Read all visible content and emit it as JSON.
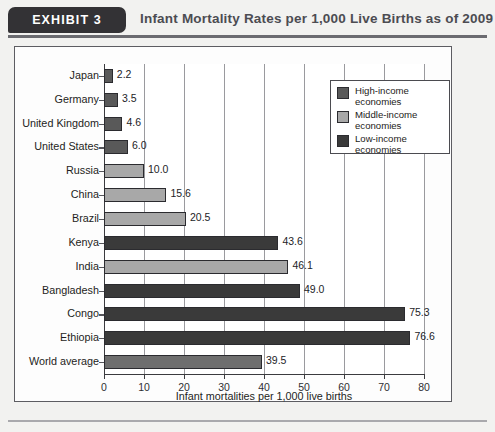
{
  "header": {
    "exhibit_badge": "EXHIBIT  3",
    "title": "Infant Mortality Rates per 1,000 Live Births as of 2009"
  },
  "legend": {
    "items": [
      {
        "label_line1": "High-income",
        "label_line2": "economies",
        "color": "#595959"
      },
      {
        "label_line1": "Middle-income",
        "label_line2": "economies",
        "color": "#a8a8a8"
      },
      {
        "label_line1": "Low-income",
        "label_line2": "economies",
        "color": "#3a3a3a"
      }
    ]
  },
  "colors": {
    "high_income": "#595959",
    "middle_income": "#a8a8a8",
    "low_income": "#3a3a3a",
    "world_average": "#6e6e6e",
    "frame": "#5d5d62",
    "grid": "#9a9a9e",
    "banner": "#333235",
    "title_text": "#4c4c52"
  },
  "chart_data": {
    "type": "bar",
    "orientation": "horizontal",
    "title": "Infant Mortality Rates per 1,000 Live Births as of 2009",
    "xlabel": "Infant mortalities per 1,000 live births",
    "ylabel": "",
    "xlim": [
      0,
      80
    ],
    "xticks": [
      0,
      10,
      20,
      30,
      40,
      50,
      60,
      70,
      80
    ],
    "xtick_labels": [
      "0",
      "10",
      "20",
      "30",
      "40",
      "50",
      "60",
      "70",
      "80"
    ],
    "grid": true,
    "legend_position": "upper right",
    "legend_entries": [
      "High-income economies",
      "Middle-income economies",
      "Low-income economies"
    ],
    "categories": [
      "Japan",
      "Germany",
      "United Kingdom",
      "United States",
      "Russia",
      "China",
      "Brazil",
      "Kenya",
      "India",
      "Bangladesh",
      "Congo",
      "Ethiopia",
      "World average"
    ],
    "values": [
      2.2,
      3.5,
      4.6,
      6.0,
      10.0,
      15.6,
      20.5,
      43.6,
      46.1,
      49.0,
      75.3,
      76.6,
      39.5
    ],
    "value_labels": [
      "2.2",
      "3.5",
      "4.6",
      "6.0",
      "10.0",
      "15.6",
      "20.5",
      "43.6",
      "46.1",
      "49.0",
      "75.3",
      "76.6",
      "39.5"
    ],
    "groups": [
      "high_income",
      "high_income",
      "high_income",
      "high_income",
      "middle_income",
      "middle_income",
      "middle_income",
      "low_income",
      "middle_income",
      "low_income",
      "low_income",
      "low_income",
      "world_average"
    ]
  }
}
